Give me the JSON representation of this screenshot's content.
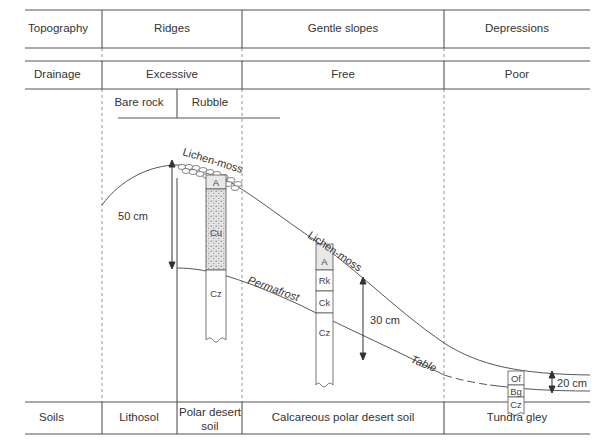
{
  "rows": {
    "topography": {
      "label": "Topography",
      "ridges": "Ridges",
      "gentle_slopes": "Gentle slopes",
      "depressions": "Depressions"
    },
    "drainage": {
      "label": "Drainage",
      "ridges": "Excessive",
      "gentle_slopes": "Free",
      "depressions": "Poor"
    },
    "substrate": {
      "bare_rock": "Bare rock",
      "rubble": "Rubble"
    },
    "soils": {
      "label": "Soils",
      "lithosol": "Lithosol",
      "polar_desert_line1": "Polar desert",
      "polar_desert_line2": "soil",
      "calcareous": "Calcareous polar desert soil",
      "tundra_gley": "Tundra gley"
    }
  },
  "annotations": {
    "lichen_moss_top": "Lichen-moss",
    "lichen_moss_slope": "Lichen-moss",
    "permafrost": "Permafrost",
    "table": "Table",
    "depth_ridge": "50 cm",
    "depth_slope": "30 cm",
    "depth_depression": "20 cm"
  },
  "profiles": {
    "polar_desert": [
      "A",
      "Cu",
      "Cz"
    ],
    "calcareous": [
      "A",
      "Rk",
      "Ck",
      "Cz"
    ],
    "tundra_gley": [
      "Of",
      "Bg",
      "Cz"
    ]
  }
}
